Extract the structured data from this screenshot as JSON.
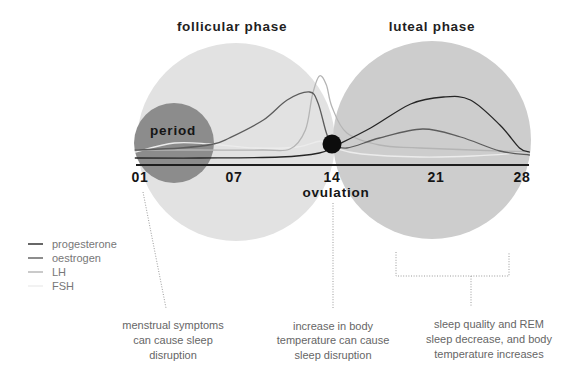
{
  "titles": {
    "follicular": "follicular phase",
    "luteal": "luteal phase"
  },
  "markers": {
    "period": "period",
    "ovulation": "ovulation"
  },
  "colors": {
    "follicular_circle": "#e2e2e2",
    "luteal_circle": "#cdcdcd",
    "period_circle": "#8c8c8c",
    "ovulation_dot": "#0d0d0d",
    "axis": "#1e1e1e"
  },
  "legend": [
    {
      "label": "progesterone",
      "color": "#262626"
    },
    {
      "label": "oestrogen",
      "color": "#5c5c5c"
    },
    {
      "label": "LH",
      "color": "#b4b4b4"
    },
    {
      "label": "FSH",
      "color": "#ececec"
    }
  ],
  "notes": [
    {
      "lines": [
        "menstrual symptoms",
        "can cause sleep",
        "disruption"
      ]
    },
    {
      "lines": [
        "increase in body",
        "temperature can cause",
        "sleep disruption"
      ]
    },
    {
      "lines": [
        "sleep quality and REM",
        "sleep decrease, and body",
        "temperature increases"
      ]
    }
  ],
  "chart_data": {
    "type": "line",
    "title": "",
    "phase_labels": [
      "follicular phase",
      "luteal phase"
    ],
    "xlabel": "",
    "ylabel": "",
    "x_ticks": [
      {
        "day": 1,
        "label": "01"
      },
      {
        "day": 7,
        "label": "07"
      },
      {
        "day": 14,
        "label": "14"
      },
      {
        "day": 21,
        "label": "21"
      },
      {
        "day": 28,
        "label": "28"
      }
    ],
    "xlim": [
      1,
      28
    ],
    "ylim": [
      0,
      100
    ],
    "grid": false,
    "legend_position": "lower-left",
    "events": [
      {
        "label": "period",
        "days": [
          1,
          5
        ]
      },
      {
        "label": "ovulation",
        "day": 14
      }
    ],
    "series": [
      {
        "name": "progesterone",
        "color": "#262626",
        "points": [
          [
            0.7,
            7
          ],
          [
            4.8,
            7
          ],
          [
            10.3,
            8
          ],
          [
            13.1,
            12
          ],
          [
            14.2,
            19
          ],
          [
            16.6,
            37
          ],
          [
            19.3,
            61
          ],
          [
            21.6,
            68
          ],
          [
            23.8,
            65
          ],
          [
            26.2,
            40
          ],
          [
            27.8,
            17
          ],
          [
            28.6,
            13
          ]
        ]
      },
      {
        "name": "oestrogen",
        "color": "#5c5c5c",
        "points": [
          [
            0.7,
            15
          ],
          [
            3.6,
            17
          ],
          [
            5.7,
            21
          ],
          [
            6.7,
            27
          ],
          [
            9.1,
            45
          ],
          [
            10.8,
            65
          ],
          [
            12.4,
            73
          ],
          [
            13.0,
            62
          ],
          [
            13.6,
            32
          ],
          [
            14.0,
            22
          ],
          [
            15.0,
            17
          ],
          [
            17.2,
            27
          ],
          [
            20.1,
            36
          ],
          [
            23.0,
            28
          ],
          [
            26.2,
            14
          ],
          [
            28.6,
            10
          ]
        ]
      },
      {
        "name": "LH",
        "color": "#b4b4b4",
        "points": [
          [
            0.7,
            15
          ],
          [
            4.8,
            15
          ],
          [
            9.0,
            15
          ],
          [
            11.0,
            16
          ],
          [
            12.1,
            35
          ],
          [
            12.6,
            70
          ],
          [
            13.1,
            89
          ],
          [
            13.6,
            80
          ],
          [
            14.0,
            58
          ],
          [
            15.0,
            32
          ],
          [
            17.2,
            20
          ],
          [
            19.9,
            17
          ],
          [
            28.6,
            13
          ]
        ]
      },
      {
        "name": "FSH",
        "color": "#ececec",
        "points": [
          [
            0.7,
            13
          ],
          [
            3.2,
            22
          ],
          [
            5.5,
            21
          ],
          [
            8.5,
            17
          ],
          [
            11.5,
            18
          ],
          [
            13.3,
            24
          ],
          [
            14.2,
            17
          ],
          [
            16.0,
            11
          ],
          [
            19.9,
            8
          ],
          [
            24.0,
            9
          ],
          [
            28.6,
            13
          ]
        ]
      }
    ]
  }
}
